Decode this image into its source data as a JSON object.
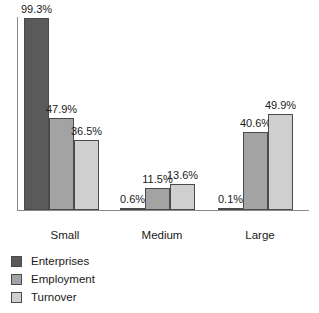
{
  "chart_data": {
    "type": "bar",
    "title": "",
    "subtitle": "",
    "xlabel": "",
    "ylabel": "",
    "ylim": [
      0,
      100
    ],
    "grid": false,
    "legend_position": "bottom-left",
    "orientation": "vertical",
    "grouping": "grouped",
    "value_suffix": "%",
    "categories": [
      "Small",
      "Medium",
      "Large"
    ],
    "series": [
      {
        "name": "Enterprises",
        "color": "#5a5a5a",
        "values": [
          99.3,
          0.6,
          0.1
        ],
        "labels": [
          "99.3%",
          "0.6%",
          "0.1%"
        ]
      },
      {
        "name": "Employment",
        "color": "#a3a3a3",
        "values": [
          47.9,
          11.5,
          40.6
        ],
        "labels": [
          "47.9%",
          "11.5%",
          "40.6%"
        ]
      },
      {
        "name": "Turnover",
        "color": "#cfcfcf",
        "values": [
          36.5,
          13.6,
          49.9
        ],
        "labels": [
          "36.5%",
          "13.6%",
          "49.9%"
        ]
      }
    ],
    "axis_color": "#8a8a8a",
    "bar_outline_color": "#4a4a4a"
  },
  "axis": {
    "category_labels": [
      "Small",
      "Medium",
      "Large"
    ]
  },
  "legend": {
    "items": [
      {
        "label": "Enterprises",
        "color": "#5a5a5a"
      },
      {
        "label": "Employment",
        "color": "#a3a3a3"
      },
      {
        "label": "Turnover",
        "color": "#cfcfcf"
      }
    ]
  },
  "bars": {
    "small": [
      {
        "series": "Enterprises",
        "label": "99.3%",
        "value": 99.3
      },
      {
        "series": "Employment",
        "label": "47.9%",
        "value": 47.9
      },
      {
        "series": "Turnover",
        "label": "36.5%",
        "value": 36.5
      }
    ],
    "medium": [
      {
        "series": "Enterprises",
        "label": "0.6%",
        "value": 0.6
      },
      {
        "series": "Employment",
        "label": "11.5%",
        "value": 11.5
      },
      {
        "series": "Turnover",
        "label": "13.6%",
        "value": 13.6
      }
    ],
    "large": [
      {
        "series": "Enterprises",
        "label": "0.1%",
        "value": 0.1
      },
      {
        "series": "Employment",
        "label": "40.6%",
        "value": 40.6
      },
      {
        "series": "Turnover",
        "label": "49.9%",
        "value": 49.9
      }
    ]
  }
}
